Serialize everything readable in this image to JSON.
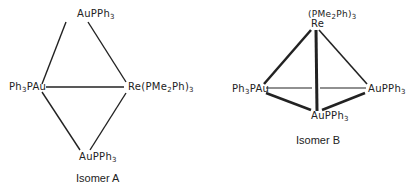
{
  "isomer_a": {
    "caption": "Isomer A",
    "top": {
      "main": "AuPPh",
      "sub": "3"
    },
    "left": {
      "pre": "Ph",
      "sub": "3",
      "post": "PAu"
    },
    "right": {
      "pre": "Re(PMe",
      "sub1": "2",
      "mid": "Ph)",
      "sub2": "3"
    },
    "bottom": {
      "main": "AuPPh",
      "sub": "3"
    }
  },
  "isomer_b": {
    "caption": "Isomer B",
    "top_ligand": {
      "pre": "(PMe",
      "sub1": "2",
      "mid": "Ph)",
      "sub2": "3"
    },
    "top_metal": "Re",
    "left": {
      "pre": "Ph",
      "sub": "3",
      "post": "PAu"
    },
    "right": {
      "main": "AuPPh",
      "sub": "3"
    },
    "bottom": {
      "main": "AuPPh",
      "sub": "3"
    }
  }
}
